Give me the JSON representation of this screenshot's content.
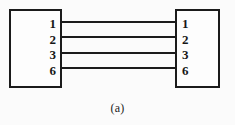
{
  "figure": {
    "caption": "(a)",
    "width": 235,
    "height": 125,
    "background_color": "#fbfbfb",
    "ink_color": "#1b1b1b"
  },
  "connectors": [
    {
      "id": "left",
      "name": "left-connector",
      "pins": [
        "1",
        "2",
        "3",
        "6"
      ]
    },
    {
      "id": "right",
      "name": "right-connector",
      "pins": [
        "1",
        "2",
        "3",
        "6"
      ]
    }
  ],
  "wires": [
    {
      "label": "wire-1",
      "from_pin": "1",
      "to_pin": "1",
      "y": 21,
      "x_start": 62,
      "x_end": 175
    },
    {
      "label": "wire-2",
      "from_pin": "2",
      "to_pin": "2",
      "y": 36,
      "x_start": 62,
      "x_end": 175
    },
    {
      "label": "wire-3",
      "from_pin": "3",
      "to_pin": "3",
      "y": 52,
      "x_start": 62,
      "x_end": 175
    },
    {
      "label": "wire-4",
      "from_pin": "6",
      "to_pin": "6",
      "y": 67,
      "x_start": 62,
      "x_end": 175
    }
  ]
}
